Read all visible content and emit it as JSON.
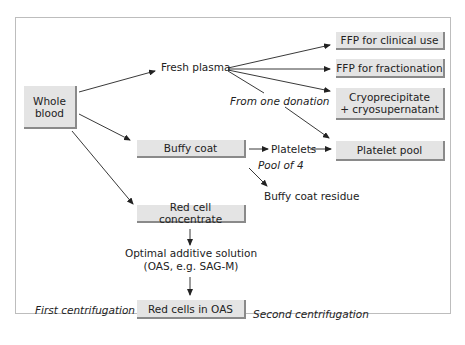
{
  "diagram": {
    "nodes": {
      "whole_blood": "Whole blood",
      "fresh_plasma": "Fresh plasma",
      "ffp_clinical": "FFP for clinical use",
      "ffp_fractionation": "FFP for fractionation",
      "cryo_line1": "Cryoprecipitate",
      "cryo_line2": "+ cryosupernatant",
      "platelet_pool": "Platelet pool",
      "buffy_coat": "Buffy coat",
      "platelets": "Platelets",
      "buffy_coat_residue": "Buffy coat residue",
      "red_cell_concentrate": "Red cell concentrate",
      "oas_line1": "Optimal additive solution",
      "oas_line2": "(OAS, e.g. SAG-M)",
      "red_cells_in_oas": "Red cells in OAS"
    },
    "annotations": {
      "from_one_donation": "From one donation",
      "pool_of_4": "Pool of 4",
      "first_centrifugation": "First centrifugation",
      "second_centrifugation": "Second centrifugation"
    },
    "colors": {
      "box_fill": "#e4e4e4",
      "box_shadow": "#8a8a8a",
      "frame": "#bdbdbd",
      "arrow": "#222222"
    }
  }
}
